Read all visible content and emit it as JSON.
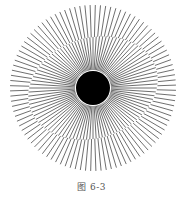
{
  "figure": {
    "caption": "图 6-3",
    "center": [
      93,
      88
    ],
    "outer_radius": 83,
    "inner_radius": 18,
    "disk_radius": 17,
    "spoke_count": 100,
    "spoke_color": "#4a4a4a",
    "disk_color": "#000000",
    "band": {
      "cx": 96,
      "cy": 88,
      "rx": 66,
      "ry": 50,
      "rotation_deg": -18,
      "offset_deg": 1.6
    }
  }
}
